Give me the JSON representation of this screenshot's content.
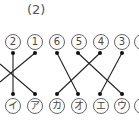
{
  "title": "(2)",
  "top_labels": [
    {
      "text": "2",
      "x": 13
    },
    {
      "text": "1",
      "x": 35
    },
    {
      "text": "6",
      "x": 57
    },
    {
      "text": "5",
      "x": 79
    },
    {
      "text": "4",
      "x": 101
    },
    {
      "text": "3",
      "x": 122
    },
    {
      "text": "",
      "x": 142
    }
  ],
  "bottom_labels": [
    {
      "text": "イ",
      "x": 13
    },
    {
      "text": "ア",
      "x": 35
    },
    {
      "text": "カ",
      "x": 57
    },
    {
      "text": "オ",
      "x": 79
    },
    {
      "text": "エ",
      "x": 101
    },
    {
      "text": "ウ",
      "x": 122
    },
    {
      "text": "",
      "x": 142
    }
  ],
  "connections": [
    {
      "from": "2",
      "to": "イ"
    },
    {
      "from": "1",
      "to": "(off-left)"
    },
    {
      "from": "(off-left)",
      "to": "ア"
    },
    {
      "from": "6",
      "to": "オ"
    },
    {
      "from": "5",
      "to": "ウ"
    },
    {
      "from": "4",
      "to": "カ"
    },
    {
      "from": "3",
      "to": "エ"
    }
  ],
  "colors": {
    "line": "#222222",
    "label_border": "#666666"
  }
}
